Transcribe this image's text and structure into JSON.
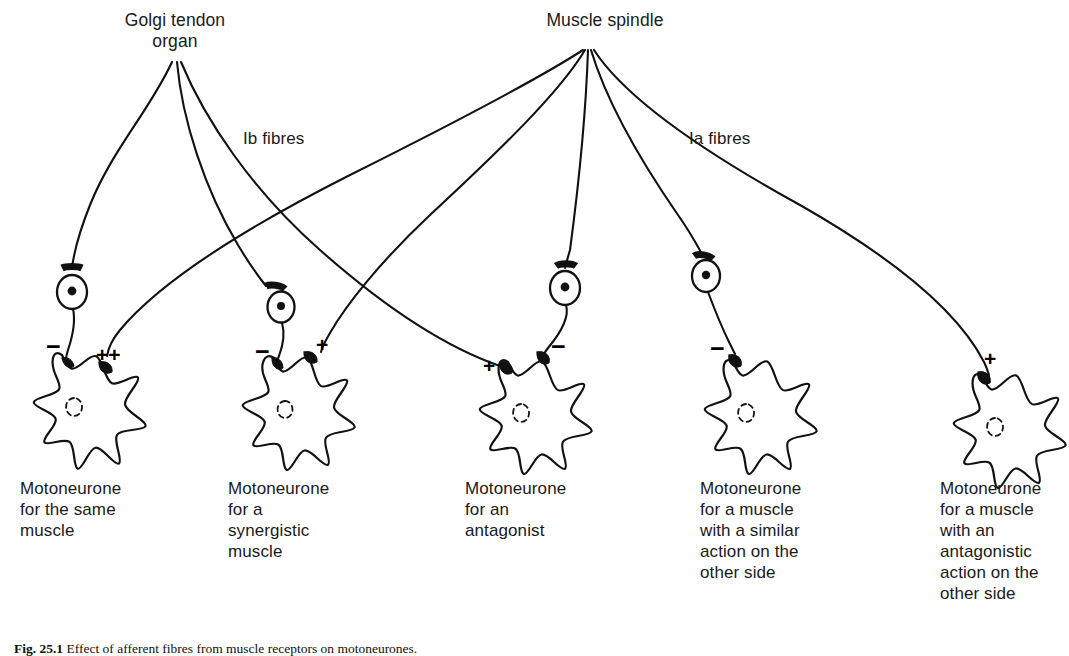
{
  "figure": {
    "receptors": [
      {
        "name": "golgi-tendon-organ",
        "label": "Golgi tendon\norgan",
        "x": 175,
        "y": 14
      },
      {
        "name": "muscle-spindle",
        "label": "Muscle spindle",
        "x": 605,
        "y": 14
      }
    ],
    "fibre_labels": [
      {
        "name": "ib-fibres",
        "label": "Ib fibres",
        "x": 243,
        "y": 128
      },
      {
        "name": "ia-fibres",
        "label": "Ia fibres",
        "x": 689,
        "y": 128
      }
    ],
    "motoneurones": [
      {
        "id": 1,
        "label": "Motoneurone\nfor the same\nmuscle",
        "x": 20,
        "y": 478,
        "signs": [
          {
            "text": "−",
            "x": 46,
            "y": 338
          },
          {
            "text": "++",
            "x": 96,
            "y": 344
          }
        ]
      },
      {
        "id": 2,
        "label": "Motoneurone\nfor a\nsynergistic\nmuscle",
        "x": 228,
        "y": 478,
        "signs": [
          {
            "text": "−",
            "x": 258,
            "y": 343
          },
          {
            "text": "+",
            "x": 316,
            "y": 338
          }
        ]
      },
      {
        "id": 3,
        "label": "Motoneurone\nfor an\nantagonist",
        "x": 465,
        "y": 478,
        "signs": [
          {
            "text": "+",
            "x": 486,
            "y": 359
          },
          {
            "text": "−",
            "x": 553,
            "y": 338
          }
        ]
      },
      {
        "id": 4,
        "label": "Motoneurone\nfor a muscle\nwith a similar\naction on the\nother side",
        "x": 700,
        "y": 478,
        "signs": [
          {
            "text": "−",
            "x": 712,
            "y": 340
          }
        ]
      },
      {
        "id": 5,
        "label": "Motoneurone\nfor a muscle\nwith an\nantagonistic\naction on the\nother side",
        "x": 940,
        "y": 478,
        "signs": [
          {
            "text": "+",
            "x": 985,
            "y": 352
          }
        ]
      }
    ],
    "caption": {
      "number": "Fig. 25.1",
      "text": "Effect of afferent fibres from muscle receptors on motoneurones."
    },
    "colors": {
      "ink": "#111111",
      "background": "#ffffff"
    }
  }
}
